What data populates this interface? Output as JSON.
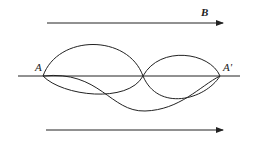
{
  "diagram": {
    "field_label": "B",
    "point_start": "A",
    "point_end": "A'",
    "colors": {
      "stroke": "#222222",
      "background": "#ffffff"
    }
  }
}
